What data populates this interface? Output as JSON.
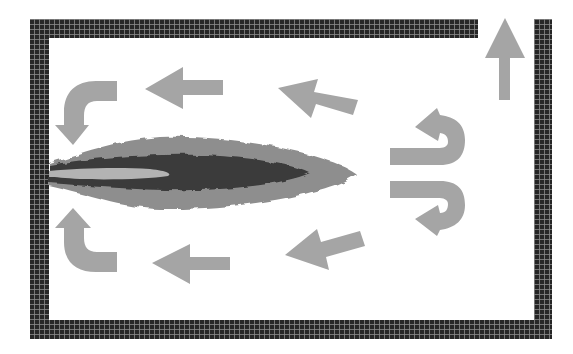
{
  "diagram": {
    "colors": {
      "wall": "#262626",
      "wall_grid": "#8a8a8a",
      "arrow": "#a5a5a5",
      "flame_outer": "#8e8e8e",
      "flame_mid": "#3a3a3a",
      "flame_core": "#b3b3b3",
      "background": "#ffffff"
    },
    "elements": {
      "enclosure": "furnace-wall",
      "burner": "flame-jet",
      "outlet": "exhaust-outlet-up-arrow",
      "flows": [
        "recirculation-top-left-curved-down",
        "recirculation-top-left-straight",
        "recirculation-top-diagonal",
        "recirculation-right-upper-uturn",
        "recirculation-right-lower-uturn",
        "recirculation-bottom-diagonal",
        "recirculation-bottom-left-straight",
        "recirculation-bottom-left-curved-up"
      ]
    }
  }
}
